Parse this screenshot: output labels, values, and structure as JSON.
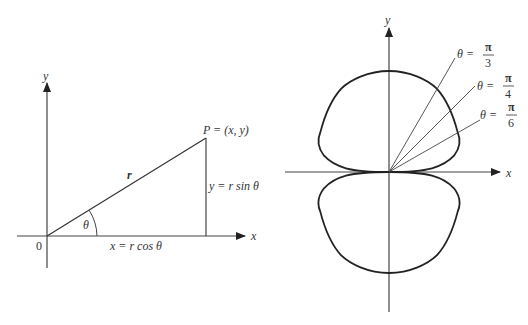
{
  "left_figure": {
    "axis_labels": {
      "x": "x",
      "y": "y",
      "origin": "0"
    },
    "point_label": "P = (x, y)",
    "radius_label": "r",
    "angle_label": "θ",
    "x_component_label": "x = r cos θ",
    "y_component_label": "y = r sin θ"
  },
  "right_figure": {
    "axis_labels": {
      "x": "x",
      "y": "y"
    },
    "rays": [
      {
        "label_lhs": "θ =",
        "numerator": "π",
        "denominator": "3",
        "angle_deg": 60
      },
      {
        "label_lhs": "θ =",
        "numerator": "π",
        "denominator": "4",
        "angle_deg": 45
      },
      {
        "label_lhs": "θ =",
        "numerator": "π",
        "denominator": "6",
        "angle_deg": 30
      }
    ],
    "curve": "two-lobed polar curve symmetric about both axes, tangent to x-axis at origin"
  },
  "colors": {
    "line": "#333333",
    "background": "#ffffff"
  }
}
